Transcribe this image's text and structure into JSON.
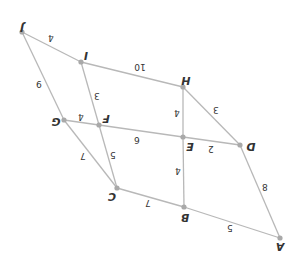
{
  "diagram": {
    "type": "weighted-undirected-graph",
    "orientation": "rotated-180",
    "nodes": [
      {
        "id": "A",
        "label": "A",
        "x": 280,
        "y": 238,
        "lx": 280,
        "ly": 246
      },
      {
        "id": "B",
        "label": "B",
        "x": 184,
        "y": 207,
        "lx": 185,
        "ly": 217
      },
      {
        "id": "C",
        "label": "C",
        "x": 117,
        "y": 188,
        "lx": 112,
        "ly": 196
      },
      {
        "id": "D",
        "label": "D",
        "x": 240,
        "y": 145,
        "lx": 251,
        "ly": 146
      },
      {
        "id": "E",
        "label": "E",
        "x": 183,
        "y": 137,
        "lx": 190,
        "ly": 146
      },
      {
        "id": "F",
        "label": "F",
        "x": 99,
        "y": 125,
        "lx": 106,
        "ly": 118
      },
      {
        "id": "G",
        "label": "G",
        "x": 64,
        "y": 120,
        "lx": 56,
        "ly": 121
      },
      {
        "id": "H",
        "label": "H",
        "x": 183,
        "y": 87,
        "lx": 186,
        "ly": 80
      },
      {
        "id": "I",
        "label": "I",
        "x": 81,
        "y": 62,
        "lx": 86,
        "ly": 55
      },
      {
        "id": "J",
        "label": "J",
        "x": 22,
        "y": 32,
        "lx": 22,
        "ly": 27
      }
    ],
    "edges": [
      {
        "from": "J",
        "to": "I",
        "weight": "4",
        "lx": 51,
        "ly": 38
      },
      {
        "from": "I",
        "to": "H",
        "weight": "10",
        "lx": 140,
        "ly": 67
      },
      {
        "from": "J",
        "to": "G",
        "weight": "9",
        "lx": 39,
        "ly": 84
      },
      {
        "from": "I",
        "to": "F",
        "weight": "3",
        "lx": 97,
        "ly": 96
      },
      {
        "from": "H",
        "to": "E",
        "weight": "4",
        "lx": 177,
        "ly": 113
      },
      {
        "from": "H",
        "to": "D",
        "weight": "3",
        "lx": 216,
        "ly": 110
      },
      {
        "from": "G",
        "to": "F",
        "weight": "4",
        "lx": 81,
        "ly": 117
      },
      {
        "from": "F",
        "to": "E",
        "weight": "6",
        "lx": 137,
        "ly": 140
      },
      {
        "from": "E",
        "to": "D",
        "weight": "2",
        "lx": 211,
        "ly": 149
      },
      {
        "from": "G",
        "to": "C",
        "weight": "7",
        "lx": 83,
        "ly": 156
      },
      {
        "from": "F",
        "to": "C",
        "weight": "5",
        "lx": 113,
        "ly": 155
      },
      {
        "from": "E",
        "to": "B",
        "weight": "4",
        "lx": 178,
        "ly": 171
      },
      {
        "from": "C",
        "to": "B",
        "weight": "7",
        "lx": 148,
        "ly": 203
      },
      {
        "from": "B",
        "to": "A",
        "weight": "5",
        "lx": 230,
        "ly": 228
      },
      {
        "from": "D",
        "to": "A",
        "weight": "8",
        "lx": 265,
        "ly": 187
      }
    ]
  }
}
